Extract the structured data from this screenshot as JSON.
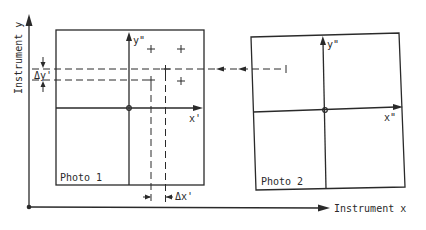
{
  "diagram": {
    "instrument_axes": {
      "x_label": "Instrument x",
      "y_label": "Instrument y"
    },
    "photo1": {
      "label": "Photo 1",
      "x_axis_label": "x'",
      "y_axis_label": "y\""
    },
    "photo2": {
      "label": "Photo 2",
      "x_axis_label": "x\"",
      "y_axis_label": "y\""
    },
    "delta_labels": {
      "dy": "Δy'",
      "dx": "Δx'"
    },
    "colors": {
      "ink": "#2a2a2a",
      "background": "#ffffff"
    }
  }
}
